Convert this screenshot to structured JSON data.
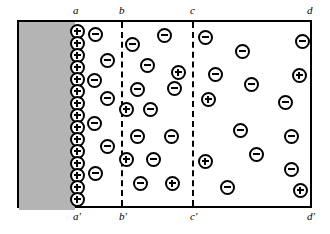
{
  "figure": {
    "frame": {
      "x": 17,
      "y": 20,
      "width": 295,
      "height": 188
    },
    "colors": {
      "electrode_fill": "#b4b4b4",
      "outline": "#000000",
      "background": "#ffffff"
    }
  },
  "electrode": {
    "name": "solid-block",
    "x": 0,
    "y": 0,
    "width": 56,
    "height": 188
  },
  "labels_top": [
    {
      "text": "a",
      "x": 73
    },
    {
      "text": "b",
      "x": 119
    },
    {
      "text": "c",
      "x": 190
    },
    {
      "text": "d",
      "x": 307
    }
  ],
  "labels_bottom": [
    {
      "text": "a′",
      "x": 73
    },
    {
      "text": "b′",
      "x": 119
    },
    {
      "text": "c′",
      "x": 190
    },
    {
      "text": "d′",
      "x": 307
    }
  ],
  "dividers": [
    {
      "name": "divider-b",
      "x": 102
    },
    {
      "name": "divider-c",
      "x": 173
    }
  ],
  "charges": [
    {
      "sign": "plus",
      "x": 58,
      "y": 9,
      "surface": true
    },
    {
      "sign": "plus",
      "x": 58,
      "y": 21,
      "surface": true
    },
    {
      "sign": "plus",
      "x": 58,
      "y": 33,
      "surface": true
    },
    {
      "sign": "plus",
      "x": 58,
      "y": 45,
      "surface": true
    },
    {
      "sign": "plus",
      "x": 58,
      "y": 57,
      "surface": true
    },
    {
      "sign": "plus",
      "x": 58,
      "y": 69,
      "surface": true
    },
    {
      "sign": "plus",
      "x": 58,
      "y": 81,
      "surface": true
    },
    {
      "sign": "plus",
      "x": 58,
      "y": 93,
      "surface": true
    },
    {
      "sign": "plus",
      "x": 58,
      "y": 105,
      "surface": true
    },
    {
      "sign": "plus",
      "x": 58,
      "y": 117,
      "surface": true
    },
    {
      "sign": "plus",
      "x": 58,
      "y": 129,
      "surface": true
    },
    {
      "sign": "plus",
      "x": 58,
      "y": 141,
      "surface": true
    },
    {
      "sign": "plus",
      "x": 58,
      "y": 153,
      "surface": true
    },
    {
      "sign": "plus",
      "x": 58,
      "y": 165,
      "surface": true
    },
    {
      "sign": "plus",
      "x": 58,
      "y": 177,
      "surface": true
    },
    {
      "sign": "minus",
      "x": 76,
      "y": 12,
      "surface": false
    },
    {
      "sign": "minus",
      "x": 88,
      "y": 38,
      "surface": false
    },
    {
      "sign": "minus",
      "x": 75,
      "y": 58,
      "surface": false
    },
    {
      "sign": "minus",
      "x": 88,
      "y": 76,
      "surface": false
    },
    {
      "sign": "minus",
      "x": 75,
      "y": 101,
      "surface": false
    },
    {
      "sign": "minus",
      "x": 88,
      "y": 124,
      "surface": false
    },
    {
      "sign": "minus",
      "x": 76,
      "y": 151,
      "surface": false
    },
    {
      "sign": "minus",
      "x": 113,
      "y": 22,
      "surface": false
    },
    {
      "sign": "minus",
      "x": 145,
      "y": 13,
      "surface": false
    },
    {
      "sign": "minus",
      "x": 128,
      "y": 43,
      "surface": false
    },
    {
      "sign": "plus",
      "x": 159,
      "y": 50,
      "surface": false
    },
    {
      "sign": "minus",
      "x": 118,
      "y": 67,
      "surface": false
    },
    {
      "sign": "minus",
      "x": 155,
      "y": 66,
      "surface": false
    },
    {
      "sign": "plus",
      "x": 107,
      "y": 87,
      "surface": false
    },
    {
      "sign": "minus",
      "x": 131,
      "y": 87,
      "surface": false
    },
    {
      "sign": "minus",
      "x": 118,
      "y": 114,
      "surface": false
    },
    {
      "sign": "minus",
      "x": 152,
      "y": 114,
      "surface": false
    },
    {
      "sign": "plus",
      "x": 107,
      "y": 137,
      "surface": false
    },
    {
      "sign": "minus",
      "x": 134,
      "y": 137,
      "surface": false
    },
    {
      "sign": "minus",
      "x": 121,
      "y": 161,
      "surface": false
    },
    {
      "sign": "plus",
      "x": 153,
      "y": 161,
      "surface": false
    },
    {
      "sign": "minus",
      "x": 186,
      "y": 15,
      "surface": false
    },
    {
      "sign": "minus",
      "x": 223,
      "y": 29,
      "surface": false
    },
    {
      "sign": "minus",
      "x": 283,
      "y": 19,
      "surface": false
    },
    {
      "sign": "minus",
      "x": 196,
      "y": 52,
      "surface": false
    },
    {
      "sign": "minus",
      "x": 232,
      "y": 62,
      "surface": false
    },
    {
      "sign": "plus",
      "x": 280,
      "y": 53,
      "surface": false
    },
    {
      "sign": "plus",
      "x": 189,
      "y": 77,
      "surface": false
    },
    {
      "sign": "minus",
      "x": 266,
      "y": 80,
      "surface": false
    },
    {
      "sign": "minus",
      "x": 221,
      "y": 108,
      "surface": false
    },
    {
      "sign": "minus",
      "x": 272,
      "y": 114,
      "surface": false
    },
    {
      "sign": "plus",
      "x": 186,
      "y": 139,
      "surface": false
    },
    {
      "sign": "minus",
      "x": 237,
      "y": 132,
      "surface": false
    },
    {
      "sign": "minus",
      "x": 272,
      "y": 147,
      "surface": false
    },
    {
      "sign": "minus",
      "x": 208,
      "y": 165,
      "surface": false
    },
    {
      "sign": "plus",
      "x": 281,
      "y": 168,
      "surface": false
    }
  ]
}
